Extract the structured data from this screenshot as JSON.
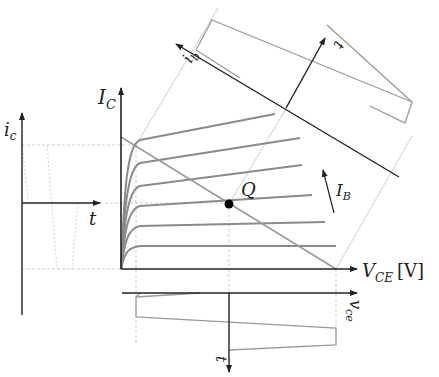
{
  "labels": {
    "ic_axis": "I",
    "ic_axis_sub": "C",
    "vce_axis": "V",
    "vce_axis_sub": "CE",
    "vce_unit": "[V]",
    "small_ic": "i",
    "small_ic_sub": "c",
    "small_t_left": "t",
    "q_point": "Q",
    "ib_arrow": "I",
    "ib_arrow_sub": "B",
    "small_vce": "v",
    "small_vce_sub": "ce",
    "small_t_bottom": "t",
    "small_ib": "i",
    "small_ib_sub": "b",
    "small_t_top": "t"
  },
  "colors": {
    "axis": "#222222",
    "curve": "#8a8a8a",
    "guide": "#c8c8c8",
    "point": "#000000"
  },
  "diagram": {
    "type": "transistor output characteristics with load line and Q-point",
    "curves_count": 7,
    "q_point": {
      "x": 229,
      "y": 204
    }
  }
}
